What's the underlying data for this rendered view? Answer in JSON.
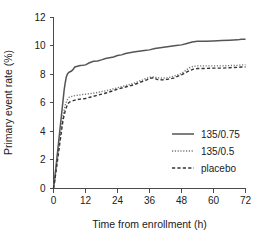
{
  "chart_data": {
    "type": "line",
    "title": "",
    "xlabel": "Time from enrollment (h)",
    "ylabel": "Primary event rate (%)",
    "xlim": [
      0,
      72
    ],
    "ylim": [
      0,
      12
    ],
    "xticks": [
      0,
      12,
      24,
      36,
      48,
      60,
      72
    ],
    "yticks": [
      0,
      2,
      4,
      6,
      8,
      10,
      12
    ],
    "grid": false,
    "legend_position": "center-right",
    "series": [
      {
        "name": "135/0.75",
        "style": "solid",
        "color": "#555555",
        "x": [
          0,
          0.4,
          0.8,
          1.2,
          1.6,
          2.0,
          2.4,
          2.8,
          3.2,
          3.6,
          4.0,
          4.4,
          4.8,
          5.2,
          5.6,
          6.0,
          6.6,
          7.2,
          8.0,
          9.0,
          10.0,
          11.0,
          12.0,
          13.5,
          15.0,
          16.5,
          18.0,
          19.5,
          21.0,
          22.5,
          24.0,
          25.5,
          27.0,
          28.5,
          30.0,
          32.0,
          34.0,
          36.0,
          38.0,
          40.0,
          42.0,
          44.0,
          46.0,
          48.0,
          50.0,
          52.0,
          54.0,
          57.0,
          60.0,
          63.0,
          66.0,
          69.0,
          70.5,
          72.0
        ],
        "y": [
          0.0,
          0.6,
          1.3,
          2.0,
          2.7,
          3.4,
          4.1,
          4.8,
          5.5,
          6.2,
          6.9,
          7.4,
          7.8,
          8.0,
          8.1,
          8.15,
          8.2,
          8.3,
          8.5,
          8.55,
          8.6,
          8.62,
          8.65,
          8.8,
          8.9,
          8.92,
          9.0,
          9.1,
          9.15,
          9.2,
          9.3,
          9.35,
          9.45,
          9.5,
          9.55,
          9.6,
          9.65,
          9.7,
          9.8,
          9.85,
          9.9,
          9.95,
          10.0,
          10.05,
          10.15,
          10.25,
          10.3,
          10.3,
          10.32,
          10.35,
          10.38,
          10.4,
          10.45,
          10.45
        ]
      },
      {
        "name": "135/0.5",
        "style": "dotted",
        "color": "#777777",
        "x": [
          0,
          0.4,
          0.8,
          1.2,
          1.6,
          2.0,
          2.4,
          2.8,
          3.2,
          3.6,
          4.0,
          4.5,
          5.0,
          5.5,
          6.0,
          7.0,
          8.0,
          9.0,
          10.0,
          11.0,
          12.0,
          14.0,
          16.0,
          18.0,
          20.0,
          22.0,
          24.0,
          26.0,
          28.0,
          30.0,
          32.0,
          33.5,
          35.0,
          36.0,
          37.5,
          39.0,
          41.0,
          43.0,
          45.0,
          46.5,
          48.0,
          49.5,
          51.0,
          52.5,
          54.0,
          57.0,
          60.0,
          63.0,
          66.0,
          69.0,
          70.5,
          72.0
        ],
        "y": [
          0.0,
          0.5,
          1.1,
          1.7,
          2.3,
          2.9,
          3.5,
          4.1,
          4.6,
          5.1,
          5.5,
          5.9,
          6.15,
          6.3,
          6.4,
          6.45,
          6.5,
          6.52,
          6.55,
          6.58,
          6.6,
          6.65,
          6.7,
          6.78,
          6.85,
          6.95,
          7.05,
          7.15,
          7.25,
          7.35,
          7.5,
          7.6,
          7.72,
          7.78,
          7.8,
          7.75,
          7.72,
          7.75,
          7.85,
          7.95,
          8.05,
          8.25,
          8.45,
          8.55,
          8.58,
          8.58,
          8.58,
          8.58,
          8.6,
          8.62,
          8.65,
          8.65
        ]
      },
      {
        "name": "placebo",
        "style": "dashed",
        "color": "#333333",
        "x": [
          0,
          0.4,
          0.8,
          1.2,
          1.6,
          2.0,
          2.4,
          2.8,
          3.2,
          3.6,
          4.0,
          4.5,
          5.0,
          5.5,
          6.0,
          7.0,
          8.0,
          9.0,
          10.0,
          11.0,
          12.0,
          14.0,
          16.0,
          18.0,
          20.0,
          22.0,
          24.0,
          26.0,
          28.0,
          30.0,
          32.0,
          33.5,
          35.0,
          36.0,
          37.5,
          39.0,
          41.0,
          43.0,
          45.0,
          46.5,
          48.0,
          49.5,
          51.0,
          52.5,
          54.0,
          57.0,
          60.0,
          63.0,
          66.0,
          69.0,
          70.5,
          72.0
        ],
        "y": [
          0.0,
          0.45,
          1.0,
          1.55,
          2.1,
          2.65,
          3.2,
          3.75,
          4.3,
          4.8,
          5.15,
          5.5,
          5.75,
          5.95,
          6.05,
          6.12,
          6.18,
          6.22,
          6.25,
          6.28,
          6.3,
          6.4,
          6.5,
          6.6,
          6.7,
          6.82,
          6.95,
          7.05,
          7.15,
          7.25,
          7.4,
          7.5,
          7.6,
          7.7,
          7.75,
          7.62,
          7.6,
          7.65,
          7.72,
          7.85,
          7.95,
          8.1,
          8.25,
          8.35,
          8.4,
          8.4,
          8.42,
          8.42,
          8.45,
          8.48,
          8.5,
          8.5
        ]
      }
    ]
  },
  "axes": {
    "x_tick_labels": [
      "0",
      "12",
      "24",
      "36",
      "48",
      "60",
      "72"
    ],
    "y_tick_labels": [
      "0",
      "2",
      "4",
      "6",
      "8",
      "10",
      "12"
    ],
    "x_title": "Time from enrollment (h)",
    "y_title": "Primary event rate (%)"
  },
  "legend": {
    "items": [
      {
        "label": "135/0.75",
        "style": "solid"
      },
      {
        "label": "135/0.5",
        "style": "dotted"
      },
      {
        "label": "placebo",
        "style": "dashed"
      }
    ]
  },
  "colors": {
    "axis": "#4a4a4a",
    "solid_series": "#555555",
    "dotted_series": "#777777",
    "dashed_series": "#333333",
    "background": "#ffffff",
    "text": "#1a1a1a"
  }
}
